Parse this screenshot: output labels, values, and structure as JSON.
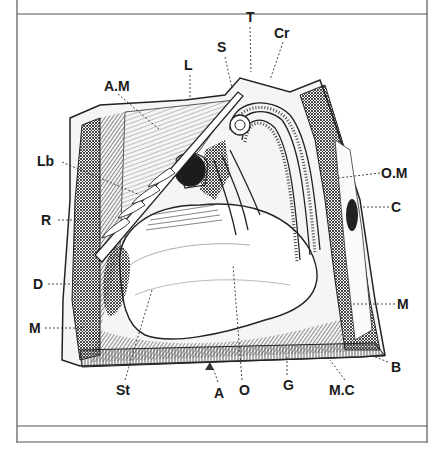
{
  "figure": {
    "type": "anatomical engraving (dissected specimen, cut-away view)",
    "colors": {
      "ink": "#1a1a1a",
      "paper": "#ffffff",
      "frame": "#555555",
      "hatch": "#3a3a3a"
    }
  },
  "labels": [
    {
      "id": "T",
      "text": "T",
      "x": 246,
      "y": 10
    },
    {
      "id": "Cr",
      "text": "Cr",
      "x": 274,
      "y": 26
    },
    {
      "id": "S",
      "text": "S",
      "x": 217,
      "y": 40
    },
    {
      "id": "L",
      "text": "L",
      "x": 184,
      "y": 58
    },
    {
      "id": "AM",
      "text": "A.M",
      "x": 104,
      "y": 79
    },
    {
      "id": "Lb",
      "text": "Lb",
      "x": 37,
      "y": 154
    },
    {
      "id": "OM",
      "text": "O.M",
      "x": 381,
      "y": 166
    },
    {
      "id": "C",
      "text": "C",
      "x": 391,
      "y": 200
    },
    {
      "id": "R",
      "text": "R",
      "x": 41,
      "y": 213
    },
    {
      "id": "D",
      "text": "D",
      "x": 33,
      "y": 277
    },
    {
      "id": "M_right",
      "text": "M",
      "x": 397,
      "y": 297
    },
    {
      "id": "M_left",
      "text": "M",
      "x": 29,
      "y": 321
    },
    {
      "id": "B",
      "text": "B",
      "x": 391,
      "y": 360
    },
    {
      "id": "St",
      "text": "St",
      "x": 116,
      "y": 383
    },
    {
      "id": "A",
      "text": "A",
      "x": 214,
      "y": 386
    },
    {
      "id": "O",
      "text": "O",
      "x": 239,
      "y": 383
    },
    {
      "id": "G",
      "text": "G",
      "x": 283,
      "y": 378
    },
    {
      "id": "MC",
      "text": "M.C",
      "x": 329,
      "y": 383
    }
  ]
}
